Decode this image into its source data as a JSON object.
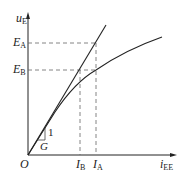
{
  "axes": {
    "y_label": "u",
    "y_label_sub": "E",
    "x_label": "i",
    "x_label_sub": "EE",
    "origin_label": "O"
  },
  "levels": {
    "E_A": {
      "label": "E",
      "sub": "A"
    },
    "E_B": {
      "label": "E",
      "sub": "B"
    },
    "I_A": {
      "label": "I",
      "sub": "A"
    },
    "I_B": {
      "label": "I",
      "sub": "B"
    }
  },
  "slope": {
    "rise_label": "1",
    "run_label": "G"
  },
  "colors": {
    "line": "#222222",
    "dash": "#666666"
  }
}
